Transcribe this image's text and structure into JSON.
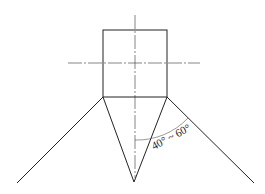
{
  "diagram": {
    "colors": {
      "line": "#222222",
      "centerline": "#333333",
      "arc": "#555555",
      "background": "#ffffff"
    },
    "shank": {
      "x": 103,
      "y": 30,
      "width": 64,
      "height": 67
    },
    "centerlines": {
      "vertical": {
        "x": 135,
        "y1": 15,
        "y2": 178
      },
      "horizontal": {
        "y": 63,
        "x1": 68,
        "x2": 200
      }
    },
    "point": {
      "left_corner": [
        103,
        97
      ],
      "right_corner": [
        167,
        97
      ],
      "tip": [
        134,
        182
      ]
    },
    "outer_lines": {
      "left": {
        "from": [
          103,
          97
        ],
        "to": [
          17,
          183
        ]
      },
      "right": {
        "from": [
          167,
          97
        ],
        "to": [
          254,
          183
        ]
      }
    },
    "angle_annotation": {
      "label": "40° ~ 60°",
      "arc_start": [
        135,
        140
      ],
      "arc_end": [
        188,
        118
      ],
      "label_x": 154,
      "label_y": 150,
      "label_rotation": -28
    }
  }
}
